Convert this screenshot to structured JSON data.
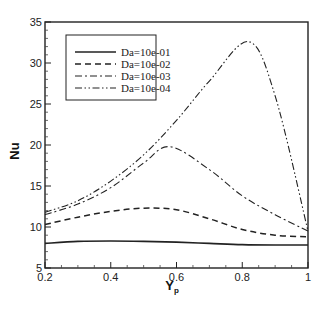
{
  "chart_data": {
    "type": "line",
    "title": "",
    "xlabel": "Y",
    "xlabel_subscript": "p",
    "ylabel": "Nu",
    "xlim": [
      0.2,
      1.0
    ],
    "ylim": [
      5,
      35
    ],
    "xticks": [
      0.2,
      0.4,
      0.6,
      0.8,
      1
    ],
    "xtick_labels": [
      "0.2",
      "0.4",
      "0.6",
      "0.8",
      "1"
    ],
    "yticks": [
      5,
      10,
      15,
      20,
      25,
      30,
      35
    ],
    "ytick_labels": [
      "5",
      "10",
      "15",
      "20",
      "25",
      "30",
      "35"
    ],
    "grid": false,
    "legend_position": "upper-left",
    "series": [
      {
        "name": "Da=10e-01",
        "style": "solid",
        "x": [
          0.2,
          0.3,
          0.4,
          0.5,
          0.6,
          0.7,
          0.8,
          0.9,
          1.0
        ],
        "y": [
          8.0,
          8.25,
          8.3,
          8.25,
          8.15,
          8.0,
          7.85,
          7.8,
          7.8
        ]
      },
      {
        "name": "Da=10e-02",
        "style": "dashed",
        "x": [
          0.2,
          0.3,
          0.4,
          0.5,
          0.6,
          0.7,
          0.8,
          0.9,
          1.0
        ],
        "y": [
          10.3,
          11.2,
          11.9,
          12.3,
          12.1,
          11.0,
          9.7,
          9.0,
          8.8
        ]
      },
      {
        "name": "Da=10e-03",
        "style": "dash-dot",
        "x": [
          0.2,
          0.3,
          0.4,
          0.5,
          0.58,
          0.7,
          0.8,
          0.9,
          1.0
        ],
        "y": [
          11.5,
          12.8,
          14.8,
          17.8,
          19.8,
          17.0,
          13.8,
          11.5,
          9.5
        ]
      },
      {
        "name": "Da=10e-04",
        "style": "dash-dot-dot",
        "x": [
          0.2,
          0.3,
          0.4,
          0.5,
          0.6,
          0.7,
          0.82,
          0.9,
          1.0
        ],
        "y": [
          11.8,
          13.2,
          15.6,
          18.8,
          23.0,
          27.8,
          32.6,
          26.0,
          9.5
        ]
      }
    ]
  }
}
